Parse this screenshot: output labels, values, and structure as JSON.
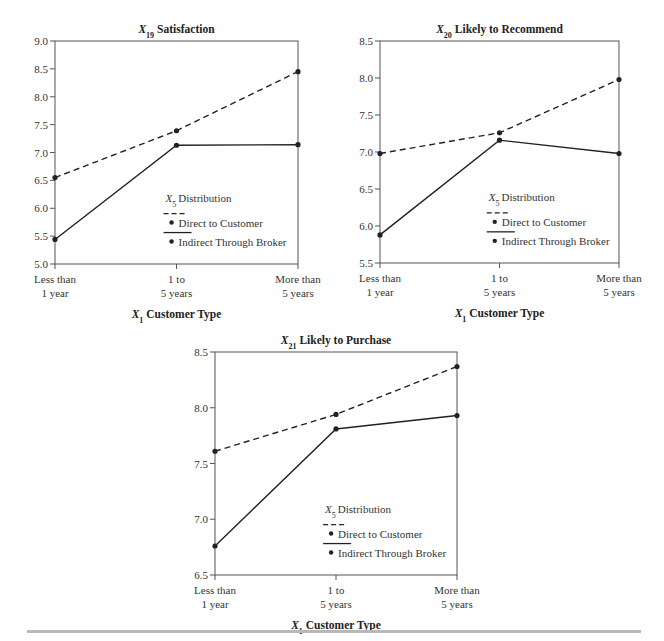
{
  "chart_data": [
    {
      "type": "line",
      "title": "Satisfaction",
      "title_var": "X",
      "title_sub": "19",
      "xlabel_var": "X",
      "xlabel_sub": "1",
      "xlabel": "Customer Type",
      "ylabel": "",
      "categories": [
        [
          "Less than",
          "1 year"
        ],
        [
          "1 to",
          "5 years"
        ],
        [
          "More than",
          "5 years"
        ]
      ],
      "ylim": [
        5.0,
        9.0
      ],
      "yticks": [
        "5.0",
        "5.5",
        "6.0",
        "6.5",
        "7.0",
        "7.5",
        "8.0",
        "8.5",
        "9.0"
      ],
      "grid": false,
      "legend": {
        "title_var": "X",
        "title_sub": "5",
        "title": "Distribution",
        "placement": "lower-right"
      },
      "series": [
        {
          "name": "Direct to Customer",
          "style": "dashed",
          "values": [
            6.55,
            7.39,
            8.45
          ]
        },
        {
          "name": "Indirect Through Broker",
          "style": "solid",
          "values": [
            5.44,
            7.13,
            7.14
          ]
        }
      ]
    },
    {
      "type": "line",
      "title": "Likely to Recommend",
      "title_var": "X",
      "title_sub": "20",
      "xlabel_var": "X",
      "xlabel_sub": "1",
      "xlabel": "Customer Type",
      "ylabel": "",
      "categories": [
        [
          "Less than",
          "1 year"
        ],
        [
          "1 to",
          "5 years"
        ],
        [
          "More than",
          "5 years"
        ]
      ],
      "ylim": [
        5.5,
        8.5
      ],
      "yticks": [
        "5.5",
        "6.0",
        "6.5",
        "7.0",
        "7.5",
        "8.0",
        "8.5"
      ],
      "grid": false,
      "legend": {
        "title_var": "X",
        "title_sub": "5",
        "title": "Distribution",
        "placement": "lower-right"
      },
      "series": [
        {
          "name": "Direct to Customer",
          "style": "dashed",
          "values": [
            6.98,
            7.26,
            7.98
          ]
        },
        {
          "name": "Indirect Through Broker",
          "style": "solid",
          "values": [
            5.88,
            7.16,
            6.98
          ]
        }
      ]
    },
    {
      "type": "line",
      "title": "Likely to Purchase",
      "title_var": "X",
      "title_sub": "21",
      "xlabel_var": "X",
      "xlabel_sub": "1",
      "xlabel": "Customer Type",
      "ylabel": "",
      "categories": [
        [
          "Less than",
          "1 year"
        ],
        [
          "1 to",
          "5 years"
        ],
        [
          "More than",
          "5 years"
        ]
      ],
      "ylim": [
        6.5,
        8.5
      ],
      "yticks": [
        "6.5",
        "7.0",
        "7.5",
        "8.0",
        "8.5"
      ],
      "grid": false,
      "legend": {
        "title_var": "X",
        "title_sub": "5",
        "title": "Distribution",
        "placement": "lower-right"
      },
      "series": [
        {
          "name": "Direct to Customer",
          "style": "dashed",
          "values": [
            7.61,
            7.94,
            8.37
          ]
        },
        {
          "name": "Indirect Through Broker",
          "style": "solid",
          "values": [
            6.76,
            7.81,
            7.93
          ]
        }
      ]
    }
  ],
  "colors": {
    "line": "#222222",
    "axis": "#555555",
    "rule": "#b8b8b8"
  }
}
